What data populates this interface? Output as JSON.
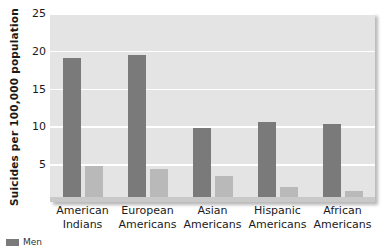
{
  "chart_data": {
    "type": "bar",
    "title": "",
    "subtitle": "",
    "xlabel": "",
    "ylabel": "Suicides per 100,000 population",
    "ylim": [
      0,
      25
    ],
    "yticks": [
      25,
      20,
      15,
      10,
      5
    ],
    "ytick_labels": [
      "25",
      "20",
      "15",
      "10",
      "5"
    ],
    "grid": "horizontal-white-gridlines",
    "legend_position": "below-plot-clipped",
    "categories": [
      "American Indians",
      "European Americans",
      "Asian Americans",
      "Hispanic Americans",
      "African Americans"
    ],
    "category_lines": [
      [
        "American",
        "Indians"
      ],
      [
        "European",
        "Americans"
      ],
      [
        "Asian",
        "Americans"
      ],
      [
        "Hispanic",
        "Americans"
      ],
      [
        "African",
        "Americans"
      ]
    ],
    "series": [
      {
        "name": "Men",
        "color": "#7a7a7a",
        "values": [
          19.0,
          19.5,
          9.8,
          10.6,
          10.3
        ]
      },
      {
        "name": "Women",
        "color": "#b9b9b9",
        "values": [
          4.7,
          4.4,
          3.4,
          2.0,
          1.5
        ]
      }
    ]
  },
  "legend": {
    "items": [
      {
        "label": "Men",
        "color": "#7a7a7a"
      }
    ]
  },
  "colors": {
    "plot_background": "#e4e4e4",
    "gridline": "#ffffff",
    "series_dark": "#7a7a7a",
    "series_light": "#b9b9b9",
    "text": "#1a1a1a",
    "page_background": "#ffffff"
  }
}
